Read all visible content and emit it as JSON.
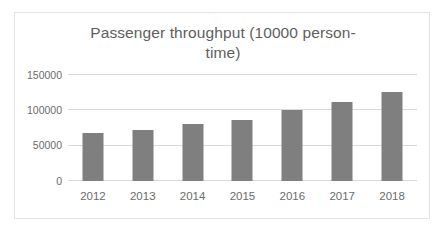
{
  "chart_data": {
    "type": "bar",
    "title_line1": "Passenger throughput (10000 person-",
    "title_line2": "time)",
    "xlabel": "",
    "ylabel": "",
    "categories": [
      "2012",
      "2013",
      "2014",
      "2015",
      "2016",
      "2017",
      "2018"
    ],
    "values": [
      68000,
      72000,
      80000,
      86000,
      100000,
      112000,
      126000
    ],
    "series": [
      {
        "name": "Passenger throughput",
        "values": [
          68000,
          72000,
          80000,
          86000,
          100000,
          112000,
          126000
        ],
        "color": "#7f7f7f"
      }
    ],
    "ylim": [
      0,
      150000
    ],
    "y_ticks": [
      0,
      50000,
      100000,
      150000
    ],
    "y_tick_labels": [
      "0",
      "50000",
      "100000",
      "150000"
    ],
    "grid": true,
    "grid_axis": "y",
    "legend": false,
    "legend_position": "none",
    "bar_color": "#7f7f7f",
    "grid_color": "#d9d9d9",
    "text_color": "#6b6b6b",
    "title_color": "#5e5e5e",
    "border_color": "#e2e2e2",
    "background": "#ffffff"
  }
}
